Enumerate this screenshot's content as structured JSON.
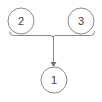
{
  "diagram": {
    "type": "tree-merge",
    "colors": {
      "stroke": "#8a8a8a",
      "text": "#444444",
      "background": "#ffffff"
    },
    "nodes": [
      {
        "id": "node-2",
        "label": "2",
        "cx": 21,
        "cy": 21,
        "r": 13
      },
      {
        "id": "node-3",
        "label": "3",
        "cx": 81,
        "cy": 21,
        "r": 13
      },
      {
        "id": "node-1",
        "label": "1",
        "cx": 54,
        "cy": 80,
        "r": 13
      }
    ],
    "edges": [
      {
        "from": [
          "node-2",
          "node-3"
        ],
        "to": "node-1",
        "style": "bracket-arrow"
      }
    ]
  }
}
